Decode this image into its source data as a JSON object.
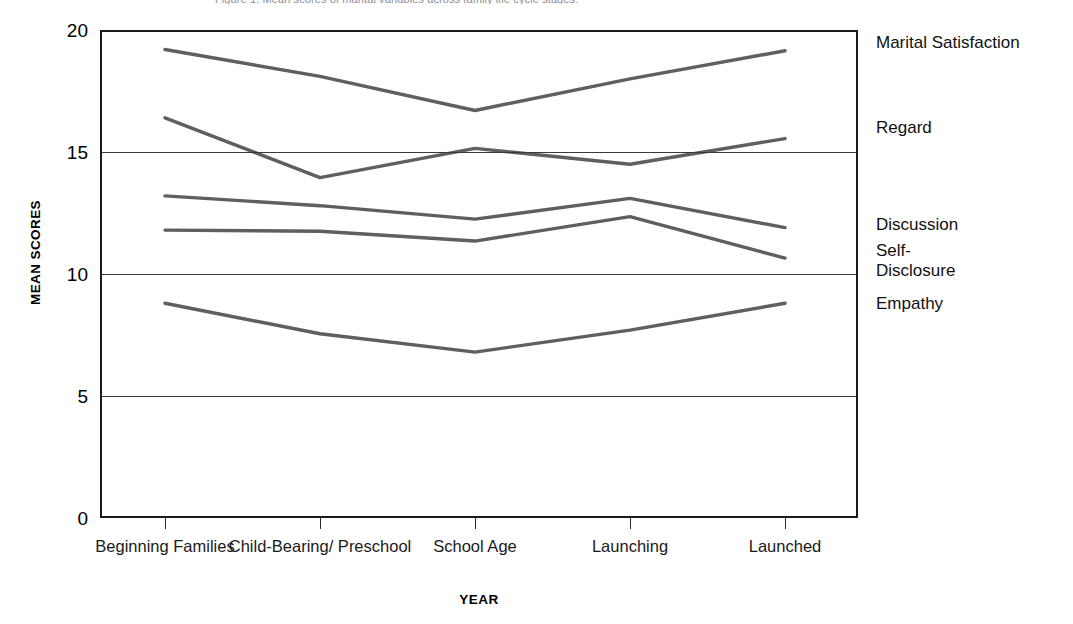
{
  "figure": {
    "top_caption": "Figure 1. Mean scores of marital variables across family life cycle stages.",
    "y_axis_title": "MEAN SCORES",
    "x_axis_title": "YEAR"
  },
  "chart_data": {
    "type": "line",
    "title": "",
    "xlabel": "YEAR",
    "ylabel": "MEAN SCORES",
    "ylim": [
      0,
      20
    ],
    "yticks": [
      0,
      5,
      10,
      15,
      20
    ],
    "grid": true,
    "legend_position": "right",
    "categories": [
      "Beginning\nFamilies",
      "Child-Bearing/\nPreschool",
      "School Age",
      "Launching",
      "Launched"
    ],
    "series": [
      {
        "name": "Marital Satisfaction",
        "values": [
          19.2,
          18.1,
          16.7,
          18.0,
          19.15
        ]
      },
      {
        "name": "Regard",
        "values": [
          16.4,
          13.95,
          15.15,
          14.5,
          15.55
        ]
      },
      {
        "name": "Discussion",
        "values": [
          13.2,
          12.8,
          12.25,
          13.1,
          11.9
        ]
      },
      {
        "name": "Self-\nDisclosure",
        "values": [
          11.8,
          11.75,
          11.35,
          12.35,
          10.65
        ]
      },
      {
        "name": "Empathy",
        "values": [
          8.8,
          7.55,
          6.8,
          7.7,
          8.8
        ]
      }
    ],
    "line_color": "#5f5f5f",
    "axis_color": "#1a1a1a"
  },
  "ytick_labels": [
    "20",
    "15",
    "10",
    "5",
    "0"
  ],
  "series_labels": [
    "Marital Satisfaction",
    "Regard",
    "Discussion",
    "Self-\nDisclosure",
    "Empathy"
  ]
}
